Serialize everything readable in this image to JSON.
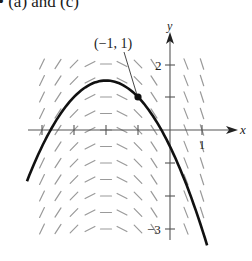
{
  "caption": "• (a) and (c)",
  "chart_data": {
    "type": "slope_field",
    "title": "",
    "differential_equation": "dy/dx = -(x + 2)",
    "xlabel": "x",
    "ylabel": "y",
    "x_tick_labels": [
      "1"
    ],
    "y_tick_labels": [
      "2",
      "-3"
    ],
    "xlim": [
      -4.5,
      1.3
    ],
    "ylim": [
      -3.5,
      2.9
    ],
    "grid": false,
    "slope_field": {
      "x_values": [
        -4,
        -3.5,
        -3,
        -2.5,
        -2,
        -1.5,
        -1,
        -0.5,
        0.5,
        1
      ],
      "y_values": [
        2,
        1.5,
        1,
        0.5,
        0,
        -0.5,
        -1,
        -1.5,
        -2,
        -2.5,
        -3
      ]
    },
    "solution_curve": {
      "equation": "y = -0.5(x + 2)^2 + 1.5",
      "x_range": [
        -4.47,
        1.16
      ],
      "vertex": [
        -2,
        1.5
      ]
    },
    "annotations": [
      {
        "text": "(−1, 1)",
        "point": [
          -1,
          1
        ]
      }
    ]
  },
  "labels": {
    "x_axis": "x",
    "y_axis": "y",
    "x_tick_1": "1",
    "y_tick_2": "2",
    "y_tick_neg3": "−3",
    "point_label": "(−1, 1)"
  }
}
